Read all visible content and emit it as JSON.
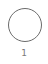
{
  "step": {
    "number": "1",
    "icon": "empty-circle-icon",
    "stroke_color": "#6b6b6b",
    "label_color": "#7a7a7a"
  }
}
